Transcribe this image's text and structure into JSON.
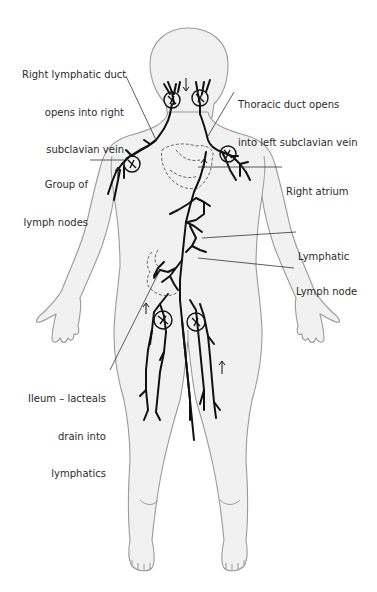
{
  "diagram": {
    "colors": {
      "body_fill": "#f1f1f1",
      "body_outline": "#9a9a9a",
      "vessel": "#111111",
      "leader_line": "#333333",
      "text": "#2a2a2a"
    },
    "labels": {
      "right_lymphatic_duct": {
        "line1": "Right lymphatic duct",
        "line2": "opens into right",
        "line3": "subclavian vein"
      },
      "thoracic_duct": {
        "line1": "Thoracic duct opens",
        "line2": "into left subclavian vein"
      },
      "group_of_lymph_nodes": {
        "line1": "Group of",
        "line2": "lymph nodes"
      },
      "right_atrium": {
        "line1": "Right atrium"
      },
      "lymphatic": {
        "line1": "Lymphatic"
      },
      "lymph_node": {
        "line1": "Lymph node"
      },
      "ileum": {
        "line1": "Ileum – lacteals",
        "line2": "drain into",
        "line3": "lymphatics"
      }
    }
  }
}
